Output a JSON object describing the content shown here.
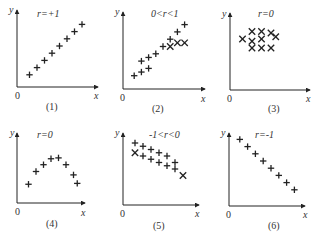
{
  "chart_data": [
    {
      "type": "scatter",
      "panel": "(1)",
      "annotation": "r=+1",
      "xlabel": "x",
      "ylabel": "y",
      "origin": "0",
      "marker": "+",
      "points": [
        [
          1,
          1
        ],
        [
          2,
          2
        ],
        [
          3,
          3
        ],
        [
          4,
          4
        ],
        [
          5,
          5
        ],
        [
          6,
          6
        ],
        [
          7,
          7
        ],
        [
          8,
          8
        ]
      ]
    },
    {
      "type": "scatter",
      "panel": "(2)",
      "annotation": "0<r<1",
      "xlabel": "x",
      "ylabel": "y",
      "origin": "0",
      "marker": "+/x",
      "points": [
        [
          1,
          1
        ],
        [
          2,
          1.5
        ],
        [
          3,
          2
        ],
        [
          2,
          3
        ],
        [
          3,
          3.5
        ],
        [
          4,
          4
        ],
        [
          5,
          5
        ],
        [
          6,
          6
        ],
        [
          7,
          7
        ],
        [
          8,
          8
        ],
        [
          6,
          5
        ],
        [
          7,
          5.5
        ],
        [
          8,
          5.5
        ]
      ]
    },
    {
      "type": "scatter",
      "panel": "(3)",
      "annotation": "r=0",
      "xlabel": "x",
      "ylabel": "y",
      "origin": "0",
      "marker": "x",
      "points": [
        [
          2,
          7
        ],
        [
          3,
          7
        ],
        [
          4,
          6.8
        ],
        [
          1,
          6
        ],
        [
          2,
          5.7
        ],
        [
          3,
          6
        ],
        [
          4.5,
          6.3
        ],
        [
          2,
          4.8
        ],
        [
          3,
          4.8
        ],
        [
          4,
          4.8
        ]
      ]
    },
    {
      "type": "scatter",
      "panel": "(4)",
      "annotation": "r=0",
      "xlabel": "x",
      "ylabel": "y",
      "origin": "0",
      "marker": "+",
      "points": [
        [
          1,
          1.5
        ],
        [
          2,
          3
        ],
        [
          3,
          3.8
        ],
        [
          4,
          4.5
        ],
        [
          5,
          4.6
        ],
        [
          6,
          3.8
        ],
        [
          7,
          2.6
        ],
        [
          7.5,
          1.6
        ]
      ]
    },
    {
      "type": "scatter",
      "panel": "(5)",
      "annotation": "-1<r<0",
      "xlabel": "x",
      "ylabel": "y",
      "origin": "0",
      "marker": "+/x",
      "points": [
        [
          1,
          8
        ],
        [
          2,
          7.5
        ],
        [
          3,
          7
        ],
        [
          4,
          6.5
        ],
        [
          5,
          6
        ],
        [
          6,
          5
        ],
        [
          1,
          6.5
        ],
        [
          2,
          6
        ],
        [
          3,
          5.5
        ],
        [
          4,
          5
        ],
        [
          5,
          4.5
        ],
        [
          6,
          4
        ],
        [
          7,
          3
        ]
      ]
    },
    {
      "type": "scatter",
      "panel": "(6)",
      "annotation": "r=-1",
      "xlabel": "x",
      "ylabel": "y",
      "origin": "0",
      "marker": "+",
      "points": [
        [
          1,
          8
        ],
        [
          2,
          7
        ],
        [
          3,
          6
        ],
        [
          4,
          5
        ],
        [
          5,
          4
        ],
        [
          6,
          3
        ],
        [
          7,
          2
        ],
        [
          8,
          1
        ]
      ]
    }
  ],
  "panels": [
    {
      "caption": "(1)",
      "annotation": "r=+1"
    },
    {
      "caption": "(2)",
      "annotation": "0<r<1"
    },
    {
      "caption": "(3)",
      "annotation": "r=0"
    },
    {
      "caption": "(4)",
      "annotation": "r=0"
    },
    {
      "caption": "(5)",
      "annotation": "-1<r<0"
    },
    {
      "caption": "(6)",
      "annotation": "r=-1"
    }
  ],
  "axis": {
    "x": "x",
    "y": "y",
    "origin": "0"
  }
}
